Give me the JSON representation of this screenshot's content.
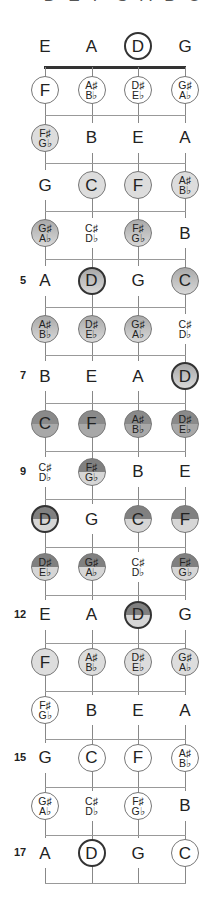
{
  "top_clipped_labels": [
    "D",
    "E",
    "F",
    "G",
    "A",
    "B",
    "C"
  ],
  "strings": [
    "E",
    "A",
    "D",
    "G"
  ],
  "open_string_highlight": "D",
  "fret_numbers": {
    "5": "5",
    "7": "7",
    "9": "9",
    "12": "12",
    "15": "15",
    "17": "17"
  },
  "rows": [
    {
      "fret": 0,
      "notes": [
        {
          "t": "E",
          "s": "plain"
        },
        {
          "t": "A",
          "s": "plain"
        },
        {
          "t": "D",
          "s": "open-bold"
        },
        {
          "t": "G",
          "s": "plain"
        }
      ]
    },
    {
      "fret": 1,
      "notes": [
        {
          "t": "F",
          "s": "open"
        },
        {
          "t": "A♯|B♭",
          "s": "open"
        },
        {
          "t": "D♯|E♭",
          "s": "open"
        },
        {
          "t": "G♯|A♭",
          "s": "open"
        }
      ]
    },
    {
      "fret": 2,
      "notes": [
        {
          "t": "F♯|G♭",
          "s": "light"
        },
        {
          "t": "B",
          "s": "plain"
        },
        {
          "t": "E",
          "s": "plain"
        },
        {
          "t": "A",
          "s": "plain"
        }
      ]
    },
    {
      "fret": 3,
      "notes": [
        {
          "t": "G",
          "s": "plain"
        },
        {
          "t": "C",
          "s": "light"
        },
        {
          "t": "F",
          "s": "light"
        },
        {
          "t": "A♯|B♭",
          "s": "light"
        }
      ]
    },
    {
      "fret": 4,
      "notes": [
        {
          "t": "G♯|A♭",
          "s": "grad"
        },
        {
          "t": "C♯|D♭",
          "s": "plain"
        },
        {
          "t": "F♯|G♭",
          "s": "grad"
        },
        {
          "t": "B",
          "s": "plain"
        }
      ]
    },
    {
      "fret": 5,
      "notes": [
        {
          "t": "A",
          "s": "plain"
        },
        {
          "t": "D",
          "s": "grad-bold"
        },
        {
          "t": "G",
          "s": "plain"
        },
        {
          "t": "C",
          "s": "grad"
        }
      ]
    },
    {
      "fret": 6,
      "notes": [
        {
          "t": "A♯|B♭",
          "s": "grad"
        },
        {
          "t": "D♯|E♭",
          "s": "grad"
        },
        {
          "t": "G♯|A♭",
          "s": "grad"
        },
        {
          "t": "C♯|D♭",
          "s": "plain"
        }
      ]
    },
    {
      "fret": 7,
      "notes": [
        {
          "t": "B",
          "s": "plain"
        },
        {
          "t": "E",
          "s": "plain"
        },
        {
          "t": "A",
          "s": "plain"
        },
        {
          "t": "D",
          "s": "grad-bold"
        }
      ]
    },
    {
      "fret": 8,
      "notes": [
        {
          "t": "C",
          "s": "dark"
        },
        {
          "t": "F",
          "s": "dark"
        },
        {
          "t": "A♯|B♭",
          "s": "dark"
        },
        {
          "t": "D♯|E♭",
          "s": "dark"
        }
      ]
    },
    {
      "fret": 9,
      "notes": [
        {
          "t": "C♯|D♭",
          "s": "plain"
        },
        {
          "t": "F♯|G♭",
          "s": "split"
        },
        {
          "t": "B",
          "s": "plain"
        },
        {
          "t": "E",
          "s": "plain"
        }
      ]
    },
    {
      "fret": 10,
      "notes": [
        {
          "t": "D",
          "s": "split-bold"
        },
        {
          "t": "G",
          "s": "plain"
        },
        {
          "t": "C",
          "s": "split"
        },
        {
          "t": "F",
          "s": "split"
        }
      ]
    },
    {
      "fret": 11,
      "notes": [
        {
          "t": "D♯|E♭",
          "s": "split"
        },
        {
          "t": "G♯|A♭",
          "s": "split"
        },
        {
          "t": "C♯|D♭",
          "s": "plain"
        },
        {
          "t": "F♯|G♭",
          "s": "split"
        }
      ]
    },
    {
      "fret": 12,
      "notes": [
        {
          "t": "E",
          "s": "plain"
        },
        {
          "t": "A",
          "s": "plain"
        },
        {
          "t": "D",
          "s": "split-bold"
        },
        {
          "t": "G",
          "s": "plain"
        }
      ]
    },
    {
      "fret": 13,
      "notes": [
        {
          "t": "F",
          "s": "light"
        },
        {
          "t": "A♯|B♭",
          "s": "light"
        },
        {
          "t": "D♯|E♭",
          "s": "light"
        },
        {
          "t": "G♯|A♭",
          "s": "light"
        }
      ]
    },
    {
      "fret": 14,
      "notes": [
        {
          "t": "F♯|G♭",
          "s": "open"
        },
        {
          "t": "B",
          "s": "plain"
        },
        {
          "t": "E",
          "s": "plain"
        },
        {
          "t": "A",
          "s": "plain"
        }
      ]
    },
    {
      "fret": 15,
      "notes": [
        {
          "t": "G",
          "s": "plain"
        },
        {
          "t": "C",
          "s": "open"
        },
        {
          "t": "F",
          "s": "open"
        },
        {
          "t": "A♯|B♭",
          "s": "open"
        }
      ]
    },
    {
      "fret": 16,
      "notes": [
        {
          "t": "G♯|A♭",
          "s": "open"
        },
        {
          "t": "C♯|D♭",
          "s": "plain"
        },
        {
          "t": "F♯|G♭",
          "s": "open"
        },
        {
          "t": "B",
          "s": "plain"
        }
      ]
    },
    {
      "fret": 17,
      "notes": [
        {
          "t": "A",
          "s": "plain"
        },
        {
          "t": "D",
          "s": "open-bold"
        },
        {
          "t": "G",
          "s": "plain"
        },
        {
          "t": "C",
          "s": "open"
        }
      ]
    }
  ]
}
